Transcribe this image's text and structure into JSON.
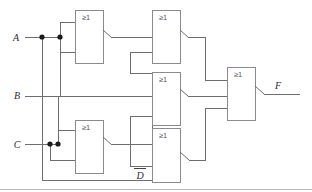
{
  "figure": {
    "kind": "logic-circuit-diagram",
    "notation": "IEC rectangular logic symbols",
    "background_color": "#ffffff",
    "wire_color": "#6e6e72",
    "gate_outline_color": "#8a8a8f",
    "label_color": "#2b2b2e",
    "junction_color": "#1a1a1a",
    "bottom_rule_color": "#b9b9bd"
  },
  "inputs": [
    {
      "id": "A",
      "label": "A",
      "x": 16,
      "y": 37,
      "negated": false
    },
    {
      "id": "B",
      "label": "B",
      "x": 17,
      "y": 95,
      "negated": false
    },
    {
      "id": "C",
      "label": "C",
      "x": 17,
      "y": 144,
      "negated": false
    },
    {
      "id": "D",
      "label": "D",
      "x": 140,
      "y": 177,
      "negated": true
    }
  ],
  "outputs": [
    {
      "id": "F",
      "label": "F",
      "x": 278,
      "y": 85,
      "negated": true
    }
  ],
  "gates": [
    {
      "id": "g1",
      "label": "≥1",
      "function": "NOR",
      "x": 75,
      "y": 10,
      "w": 28,
      "h": 53,
      "label_x": 82,
      "label_y": 20,
      "inverted_output": true
    },
    {
      "id": "g2",
      "label": "≥1",
      "function": "NOR",
      "x": 152,
      "y": 10,
      "w": 28,
      "h": 53,
      "label_x": 159,
      "label_y": 20,
      "inverted_output": true
    },
    {
      "id": "g3",
      "label": "≥1",
      "function": "NOR",
      "x": 152,
      "y": 72,
      "w": 28,
      "h": 53,
      "label_x": 159,
      "label_y": 82,
      "inverted_output": true
    },
    {
      "id": "g4",
      "label": "≥1",
      "function": "NOR",
      "x": 75,
      "y": 120,
      "w": 28,
      "h": 53,
      "label_x": 82,
      "label_y": 130,
      "inverted_output": true
    },
    {
      "id": "g5",
      "label": "≥1",
      "function": "NOR",
      "x": 152,
      "y": 128,
      "w": 28,
      "h": 54,
      "label_x": 159,
      "label_y": 138,
      "inverted_output": true
    },
    {
      "id": "g6",
      "label": "≥1",
      "function": "NOR",
      "x": 227,
      "y": 67,
      "w": 28,
      "h": 53,
      "label_x": 234,
      "label_y": 77,
      "inverted_output": true
    }
  ],
  "junctions": [
    {
      "id": "j-a1",
      "x": 42,
      "y": 37
    },
    {
      "id": "j-a2",
      "x": 60,
      "y": 37
    },
    {
      "id": "j-c1",
      "x": 50,
      "y": 144
    },
    {
      "id": "j-c2",
      "x": 58,
      "y": 144
    }
  ],
  "wires": {
    "orthogonal": [
      "M25,37 H60",
      "M42,37 V180 H152",
      "M60,37 V22 H75",
      "M60,37 V52 H75",
      "M60,37 V96",
      "M103,37 H152",
      "M152,52 H130 V73",
      "M25,144 H58",
      "M50,144 V160 H75",
      "M58,144 V130 H75",
      "M58,144 V96",
      "M103,144 H152 V110",
      "M130,73 H152",
      "M25,96 H152",
      "M152,96 H130",
      "M180,37 H205 V80 H227",
      "M180,96 H227",
      "M180,160 H205 V108 H227",
      "M130,160 H152",
      "M130,160 V116 H152",
      "M255,94 H300"
    ],
    "output_wedges": [
      {
        "gate": "g1",
        "x1": 103,
        "y1": 30,
        "x2": 112,
        "y2": 38
      },
      {
        "gate": "g2",
        "x1": 180,
        "y1": 30,
        "x2": 189,
        "y2": 38
      },
      {
        "gate": "g3",
        "x1": 180,
        "y1": 89,
        "x2": 189,
        "y2": 97
      },
      {
        "gate": "g4",
        "x1": 103,
        "y1": 137,
        "x2": 112,
        "y2": 145
      },
      {
        "gate": "g5",
        "x1": 180,
        "y1": 152,
        "x2": 189,
        "y2": 160
      },
      {
        "gate": "g6",
        "x1": 255,
        "y1": 86,
        "x2": 264,
        "y2": 94
      }
    ]
  },
  "bottom_rule": {
    "x1": 0,
    "y1": 189,
    "x2": 312,
    "y2": 189
  }
}
